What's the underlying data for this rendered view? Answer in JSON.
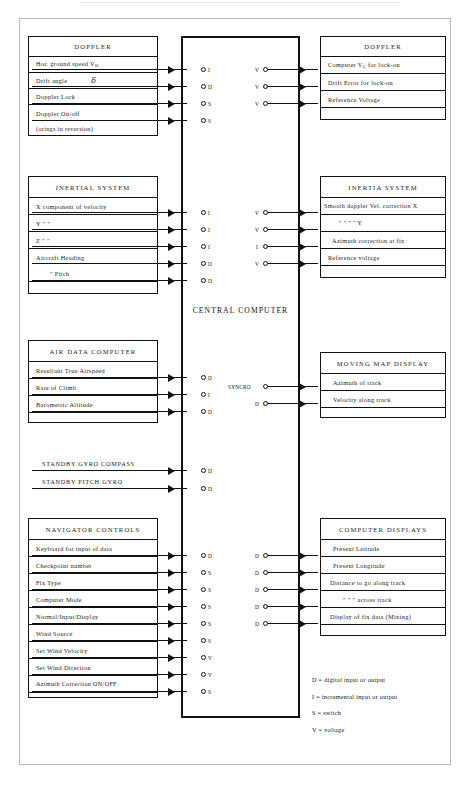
{
  "diagram": {
    "central_label": "CENTRAL   COMPUTER",
    "left_units": [
      {
        "name": "doppler-input",
        "title": "DOPPLER",
        "rows": [
          {
            "text": "Hor. ground speed V",
            "sub": "D",
            "signal": "I"
          },
          {
            "text": "Drift angle",
            "symbol": "δ",
            "signal": "D"
          },
          {
            "text": "Doppler Lock",
            "signal": "S"
          },
          {
            "text": "Doppler On/off",
            "signal": "S"
          },
          {
            "text": "(orings in reversion)",
            "signal": ""
          }
        ]
      },
      {
        "name": "inertial-system",
        "title": "INERTIAL SYSTEM",
        "rows": [
          {
            "text": "X component of velocity",
            "signal": "I"
          },
          {
            "text": "Y            \"                \"",
            "signal": "I"
          },
          {
            "text": "Z            \"                \"",
            "signal": "I"
          },
          {
            "text": "Aircraft Heading",
            "signal": "D"
          },
          {
            "text": "\"      Pitch",
            "signal": "D"
          },
          {
            "text": "",
            "signal": ""
          }
        ]
      },
      {
        "name": "air-data-computer",
        "title": "AIR DATA COMPUTER",
        "rows": [
          {
            "text": "Resultant True Airspeed",
            "signal": "D"
          },
          {
            "text": "Rate of Climb",
            "signal": "I"
          },
          {
            "text": "Barometric Altitude",
            "signal": "D"
          },
          {
            "text": "",
            "signal": ""
          }
        ]
      },
      {
        "name": "navigator-controls",
        "title": "NAVIGATOR CONTROLS",
        "rows": [
          {
            "text": "Keyboard for input of data",
            "signal": "D"
          },
          {
            "text": "Checkpoint number",
            "signal": "S"
          },
          {
            "text": "Fix Type",
            "signal": "S"
          },
          {
            "text": "Computer Mode",
            "signal": "S"
          },
          {
            "text": "Normal/Input/Display",
            "signal": "S"
          },
          {
            "text": "Wind Source",
            "signal": "S"
          },
          {
            "text": "Set Wind Velocity",
            "signal": "V"
          },
          {
            "text": "Set Wind Direction",
            "signal": "V"
          },
          {
            "text": "Azimuth Correction ON/OFF",
            "signal": "S"
          },
          {
            "text": "",
            "signal": ""
          }
        ]
      }
    ],
    "standby_lines": [
      {
        "text": "STANDBY GYRO COMPASS",
        "signal": "D"
      },
      {
        "text": "STANDBY PITCH GYRO",
        "signal": "D"
      }
    ],
    "right_units": [
      {
        "name": "doppler-output",
        "title": "DOPPLER",
        "rows": [
          {
            "text": "Computer V",
            "sub": "C",
            "text2": " for lock-on",
            "signal": "V"
          },
          {
            "text": "Drift Error for lock-on",
            "signal": "V"
          },
          {
            "text": "Reference Voltage",
            "signal": "V"
          },
          {
            "text": "",
            "signal": ""
          }
        ]
      },
      {
        "name": "inertia-system",
        "title": "INERTIA SYSTEM",
        "rows": [
          {
            "text": "Smooth doppler Vel. correction X",
            "signal": "V"
          },
          {
            "text": "\"        \"        \"        \"        Y",
            "signal": "V"
          },
          {
            "text": "Azimuth correction at fix",
            "signal": "I"
          },
          {
            "text": "Reference voltage",
            "signal": "V"
          },
          {
            "text": "",
            "signal": ""
          }
        ]
      },
      {
        "name": "moving-map-display",
        "title": "MOVING MAP DISPLAY",
        "rows": [
          {
            "text": "Azimuth of track",
            "signal": "SYNCRO"
          },
          {
            "text": "Velocity along track",
            "signal": "D"
          },
          {
            "text": "",
            "signal": ""
          }
        ]
      },
      {
        "name": "computer-displays",
        "title": "COMPUTER DISPLAYS",
        "rows": [
          {
            "text": "Present Latitude",
            "signal": "D"
          },
          {
            "text": "Present Longitude",
            "signal": "D"
          },
          {
            "text": "Distance to go along track",
            "signal": "D"
          },
          {
            "text": "\"      \"   \"  across track",
            "signal": "D"
          },
          {
            "text": "Display of fix data (Mixing)",
            "signal": "D"
          },
          {
            "text": "",
            "signal": ""
          }
        ]
      }
    ],
    "legend": [
      "D = digital input or output",
      "I = incremental input or output",
      "S = switch",
      "V = voltage"
    ]
  }
}
